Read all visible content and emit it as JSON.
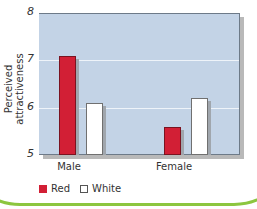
{
  "chart_data": {
    "type": "bar",
    "title": "",
    "xlabel": "",
    "ylabel": "Perceived attractiveness",
    "ylim": [
      5,
      8
    ],
    "yticks": [
      "5",
      "6",
      "7",
      "8"
    ],
    "categories": [
      "Male",
      "Female"
    ],
    "series": [
      {
        "name": "Red",
        "color": "#d21f35",
        "values": [
          7.1,
          5.6
        ]
      },
      {
        "name": "White",
        "color": "#ffffff",
        "values": [
          6.1,
          6.2
        ]
      }
    ],
    "grid": true,
    "legend_position": "bottom-left"
  },
  "colors": {
    "plot_bg": "#c3d3e6",
    "frame": "#8cc63f"
  }
}
